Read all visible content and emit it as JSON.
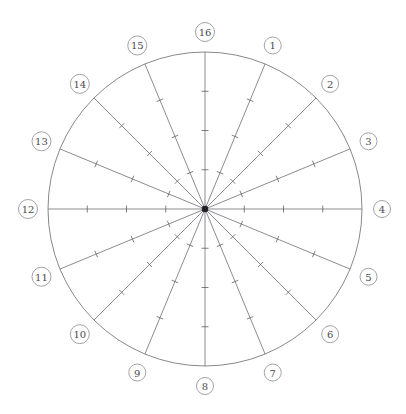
{
  "figure": {
    "title": "",
    "top_strip_text": "",
    "background_color": "#ffffff"
  },
  "chart_data": {
    "type": "scatter",
    "title": "",
    "xlabel": "",
    "ylabel": "",
    "geometry": {
      "center_x": 205,
      "center_y": 209,
      "radius": 157,
      "label_offset": 20,
      "tick_half_length": 3.5,
      "spoke_count": 16,
      "ticks_per_spoke": 3,
      "tick_fractions": [
        0.25,
        0.5,
        0.75
      ],
      "start_angle_deg": -90,
      "angle_step_deg": 22.5,
      "direction": "clockwise"
    },
    "colors": {
      "rim": "#7a7a80",
      "spoke": "#6f6f76",
      "tick": "#5f5f66",
      "hub": "#222226",
      "label_ring": "#8b8b92",
      "label_text": "#4a4a50"
    },
    "sectors": [
      {
        "label": "1",
        "angle_deg": 22.5
      },
      {
        "label": "2",
        "angle_deg": 45
      },
      {
        "label": "3",
        "angle_deg": 67.5
      },
      {
        "label": "4",
        "angle_deg": 90
      },
      {
        "label": "5",
        "angle_deg": 112.5
      },
      {
        "label": "6",
        "angle_deg": 135
      },
      {
        "label": "7",
        "angle_deg": 157.5
      },
      {
        "label": "8",
        "angle_deg": 180
      },
      {
        "label": "9",
        "angle_deg": 202.5
      },
      {
        "label": "10",
        "angle_deg": 225
      },
      {
        "label": "11",
        "angle_deg": 247.5
      },
      {
        "label": "12",
        "angle_deg": 270
      },
      {
        "label": "13",
        "angle_deg": 292.5
      },
      {
        "label": "14",
        "angle_deg": 315
      },
      {
        "label": "15",
        "angle_deg": 337.5
      },
      {
        "label": "16",
        "angle_deg": 0
      }
    ],
    "legend": [],
    "annotations": []
  }
}
